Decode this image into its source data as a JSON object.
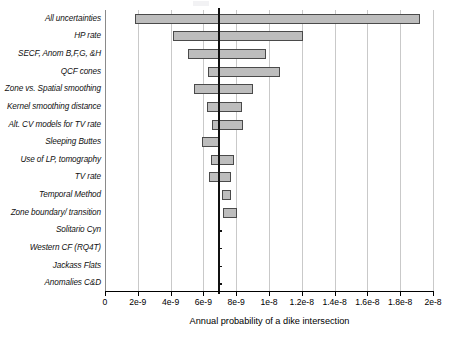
{
  "chart_data": {
    "type": "bar",
    "orientation": "horizontal",
    "subtype": "tornado-range-bar",
    "title": "",
    "xlabel": "Annual probability of a dike intersection",
    "ylabel": "",
    "xlim": [
      0,
      2e-08
    ],
    "xticks": [
      0,
      2e-09,
      4e-09,
      6e-09,
      8e-09,
      1e-08,
      1.2e-08,
      1.4e-08,
      1.6e-08,
      1.8e-08,
      2e-08
    ],
    "xtick_labels": [
      "0",
      "2e-9",
      "4e-9",
      "6e-9",
      "8e-9",
      "1e-8",
      "1.2e-8",
      "1.4e-8",
      "1.6e-8",
      "1.8e-8",
      "2e-8"
    ],
    "grid": true,
    "grid_axis": "x",
    "legend": null,
    "reference_line": {
      "label": "base case",
      "value": 6.95e-09
    },
    "categories": [
      "All uncertainties",
      "HP rate",
      "SECF, Anom B,F,G, &H",
      "QCF cones",
      "Zone vs. Spatial smoothing",
      "Kernel smoothing distance",
      "Alt. CV models for TV rate",
      "Sleeping Buttes",
      "Use of LP, tomography",
      "TV rate",
      "Temporal Method",
      "Zone boundary/ transition",
      "Solitario Cyn",
      "Western CF (RQ4T)",
      "Jackass Flats",
      "Anomalies C&D"
    ],
    "ranges": [
      {
        "category": "All uncertainties",
        "low": 1.83e-09,
        "high": 1.92e-08
      },
      {
        "category": "HP rate",
        "low": 4.15e-09,
        "high": 1.208e-08
      },
      {
        "category": "SECF, Anom B,F,G, &H",
        "low": 5.06e-09,
        "high": 9.82e-09
      },
      {
        "category": "QCF cones",
        "low": 6.28e-09,
        "high": 1.067e-08
      },
      {
        "category": "Zone vs. Spatial smoothing",
        "low": 5.43e-09,
        "high": 9.02e-09
      },
      {
        "category": "Kernel smoothing distance",
        "low": 6.22e-09,
        "high": 8.35e-09
      },
      {
        "category": "Alt. CV models for TV rate",
        "low": 6.52e-09,
        "high": 8.41e-09
      },
      {
        "category": "Sleeping Buttes",
        "low": 5.91e-09,
        "high": 6.95e-09
      },
      {
        "category": "Use of LP, tomography",
        "low": 6.46e-09,
        "high": 7.87e-09
      },
      {
        "category": "TV rate",
        "low": 6.34e-09,
        "high": 7.68e-09
      },
      {
        "category": "Temporal Method",
        "low": 7.13e-09,
        "high": 7.68e-09
      },
      {
        "category": "Zone boundary/ transition",
        "low": 7.2e-09,
        "high": 8.05e-09
      },
      {
        "category": "Solitario Cyn",
        "low": 6.95e-09,
        "high": 6.95e-09
      },
      {
        "category": "Western CF (RQ4T)",
        "low": 6.95e-09,
        "high": 6.95e-09
      },
      {
        "category": "Jackass Flats",
        "low": 6.95e-09,
        "high": 6.95e-09
      },
      {
        "category": "Anomalies C&D",
        "low": 6.95e-09,
        "high": 6.95e-09
      }
    ]
  },
  "style": {
    "bar_fill": "#bdbdbd",
    "bar_stroke": "#4a4a4a",
    "grid_color": "#c9c9c9",
    "axis_color": "#000000",
    "reference_line_color": "#111111"
  }
}
